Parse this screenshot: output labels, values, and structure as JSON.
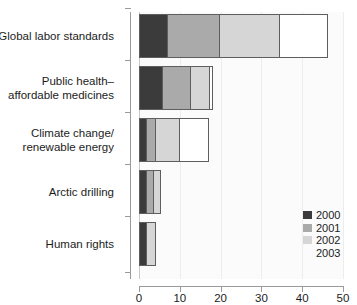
{
  "chart_data": {
    "type": "bar",
    "orientation": "horizontal",
    "stacked": true,
    "title": "",
    "xlabel": "",
    "ylabel": "",
    "xlim": [
      0,
      50
    ],
    "xticks": [
      0,
      10,
      20,
      30,
      40,
      50
    ],
    "grid": true,
    "legend_position": "bottom-right",
    "categories": [
      "Global labor standards",
      "Public health– affordable medicines",
      "Climate change/ renewable energy",
      "Arctic drilling",
      "Human rights"
    ],
    "series": [
      {
        "name": "2000",
        "color": "#3b3b3b",
        "values": [
          7,
          6,
          2,
          2,
          2
        ]
      },
      {
        "name": "2001",
        "color": "#aaaaaa",
        "values": [
          13,
          7,
          2.5,
          2,
          0
        ]
      },
      {
        "name": "2002",
        "color": "#d6d6d6",
        "values": [
          15,
          5,
          6,
          2,
          2.5
        ]
      },
      {
        "name": "2003",
        "color": "#ffffff",
        "values": [
          12,
          1,
          7.5,
          0,
          0
        ]
      }
    ],
    "totals": [
      47,
      19,
      18,
      6,
      4.5
    ]
  },
  "axis": {
    "x_tick_labels": [
      "0",
      "10",
      "20",
      "30",
      "40",
      "50"
    ]
  },
  "categories_display": [
    {
      "lines": [
        "Global labor standards"
      ]
    },
    {
      "lines": [
        "Public health–",
        "affordable medicines"
      ]
    },
    {
      "lines": [
        "Climate change/",
        "renewable energy"
      ]
    },
    {
      "lines": [
        "Arctic drilling"
      ]
    },
    {
      "lines": [
        "Human rights"
      ]
    }
  ],
  "legend": {
    "items": [
      {
        "label": "2000",
        "color": "#3b3b3b",
        "bordered": true
      },
      {
        "label": "2001",
        "color": "#aaaaaa",
        "bordered": false
      },
      {
        "label": "2002",
        "color": "#d6d6d6",
        "bordered": false
      },
      {
        "label": "2003",
        "color": "#ffffff",
        "bordered": false
      }
    ]
  },
  "top_ghost_text": ""
}
